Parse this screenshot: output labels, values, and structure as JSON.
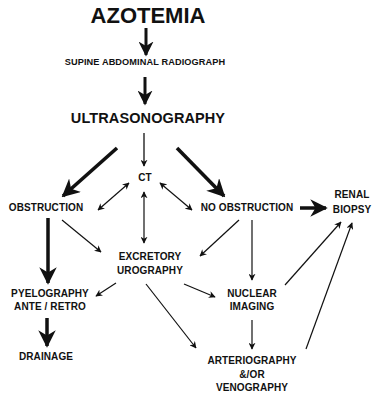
{
  "diagram": {
    "title": "AZOTEMIA",
    "nodes": {
      "supine": "SUPINE ABDOMINAL RADIOGRAPH",
      "ultrasonography": "ULTRASONOGRAPHY",
      "ct": "CT",
      "obstruction": "OBSTRUCTION",
      "no_obstruction": "NO OBSTRUCTION",
      "renal_biopsy_1": "RENAL",
      "renal_biopsy_2": "BIOPSY",
      "excretory_1": "EXCRETORY",
      "excretory_2": "UROGRAPHY",
      "pyelography_1": "PYELOGRAPHY",
      "pyelography_2": "ANTE / RETRO",
      "nuclear_1": "NUCLEAR",
      "nuclear_2": "IMAGING",
      "drainage": "DRAINAGE",
      "arterio_1": "ARTERIOGRAPHY",
      "arterio_2": "&/OR",
      "arterio_3": "VENOGRAPHY"
    },
    "edges": [
      {
        "from": "AZOTEMIA",
        "to": "SUPINE ABDOMINAL RADIOGRAPH",
        "style": "thick"
      },
      {
        "from": "SUPINE ABDOMINAL RADIOGRAPH",
        "to": "ULTRASONOGRAPHY",
        "style": "thick"
      },
      {
        "from": "ULTRASONOGRAPHY",
        "to": "CT",
        "style": "thin"
      },
      {
        "from": "ULTRASONOGRAPHY",
        "to": "OBSTRUCTION",
        "style": "thick"
      },
      {
        "from": "ULTRASONOGRAPHY",
        "to": "NO OBSTRUCTION",
        "style": "thick"
      },
      {
        "from": "CT",
        "to": "OBSTRUCTION",
        "style": "bidirectional"
      },
      {
        "from": "CT",
        "to": "NO OBSTRUCTION",
        "style": "bidirectional"
      },
      {
        "from": "CT",
        "to": "EXCRETORY UROGRAPHY",
        "style": "bidirectional"
      },
      {
        "from": "NO OBSTRUCTION",
        "to": "RENAL BIOPSY",
        "style": "thick"
      },
      {
        "from": "OBSTRUCTION",
        "to": "EXCRETORY UROGRAPHY",
        "style": "thin"
      },
      {
        "from": "NO OBSTRUCTION",
        "to": "EXCRETORY UROGRAPHY",
        "style": "thin"
      },
      {
        "from": "NO OBSTRUCTION",
        "to": "NUCLEAR IMAGING",
        "style": "thin"
      },
      {
        "from": "OBSTRUCTION",
        "to": "PYELOGRAPHY ANTE / RETRO",
        "style": "thick"
      },
      {
        "from": "EXCRETORY UROGRAPHY",
        "to": "PYELOGRAPHY ANTE / RETRO",
        "style": "thin"
      },
      {
        "from": "EXCRETORY UROGRAPHY",
        "to": "NUCLEAR IMAGING",
        "style": "thin"
      },
      {
        "from": "EXCRETORY UROGRAPHY",
        "to": "ARTERIOGRAPHY &/OR VENOGRAPHY",
        "style": "thin"
      },
      {
        "from": "NUCLEAR IMAGING",
        "to": "ARTERIOGRAPHY &/OR VENOGRAPHY",
        "style": "thin"
      },
      {
        "from": "NUCLEAR IMAGING",
        "to": "RENAL BIOPSY",
        "style": "thin"
      },
      {
        "from": "ARTERIOGRAPHY &/OR VENOGRAPHY",
        "to": "RENAL BIOPSY",
        "style": "thin"
      },
      {
        "from": "PYELOGRAPHY ANTE / RETRO",
        "to": "DRAINAGE",
        "style": "thick"
      }
    ]
  }
}
